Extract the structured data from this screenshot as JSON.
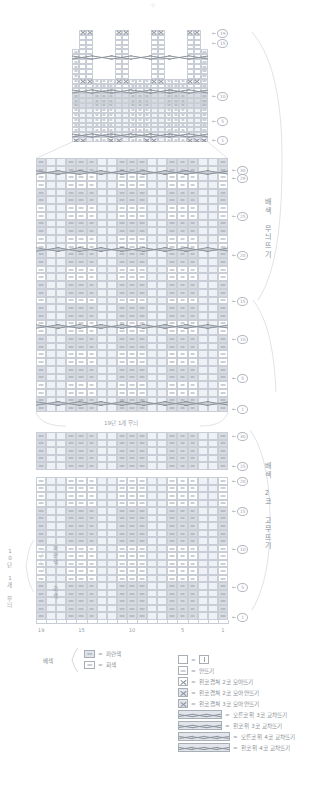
{
  "meta": {
    "doc_type": "knitting-chart",
    "language": "ko"
  },
  "labels": {
    "top_section_right": "배색 무늬뜨기",
    "bottom_section_right": "배색 2코 고무뜨기",
    "left_repeat": "10단 1개 무늬",
    "left_color_blue": "파란색",
    "left_color_gray": "회색",
    "middle_caption": "19단 1개 무늬",
    "base_color_label": "배색"
  },
  "color_legend": {
    "items": [
      {
        "swatch": "blue",
        "equals": "=",
        "name": "파란색"
      },
      {
        "swatch": "white",
        "equals": "=",
        "name": "회색"
      }
    ]
  },
  "symbol_legend": {
    "items": [
      {
        "symbol": "box-bar",
        "equals": "=",
        "label": ""
      },
      {
        "symbol": "purl",
        "equals": "=",
        "label": "안뜨기"
      },
      {
        "symbol": "k2tog-left",
        "equals": "=",
        "label": "왼코 겹쳐 2코 모아뜨기"
      },
      {
        "symbol": "k2tog-left-p",
        "equals": "=",
        "label": "왼코 겹쳐 2코 모아 안뜨기"
      },
      {
        "symbol": "k3tog-left-p",
        "equals": "=",
        "label": "왼코 겹쳐 3코 모아 안뜨기"
      },
      {
        "symbol": "cable-r3",
        "equals": "=",
        "label": "오른코 위 3코 교차뜨기"
      },
      {
        "symbol": "cable-l3",
        "equals": "=",
        "label": "왼코 위 3코 교차뜨기"
      },
      {
        "symbol": "cable-r4",
        "equals": "=",
        "label": "오른코 위 4코 교차뜨기"
      },
      {
        "symbol": "cable-l4",
        "equals": "=",
        "label": "왼코 위 4코 교차뜨기"
      }
    ]
  },
  "chart_data": {
    "type": "table",
    "xlabel": "코 (stitches)",
    "ylabel": "단 (rows)",
    "column_tick_labels": [
      "19",
      "15",
      "10",
      "5",
      "1"
    ],
    "column_tick_positions": [
      19,
      15,
      10,
      5,
      1
    ],
    "columns_total": 19,
    "sections": [
      {
        "name": "top-shaping",
        "row_tick_labels": [
          "1",
          "5",
          "10",
          "15",
          "19"
        ],
        "rows": 23,
        "cols": 19,
        "note": "shaped / decreasing top with cable crossings"
      },
      {
        "name": "main-colorwork",
        "row_tick_labels": [
          "1",
          "5",
          "10",
          "15",
          "20",
          "25",
          "29",
          "30"
        ],
        "rows": 33,
        "cols": 19,
        "repeat_caption": "19단 1개 무늬"
      },
      {
        "name": "ribbing",
        "row_tick_labels": [
          "1",
          "5",
          "10",
          "15",
          "20",
          "25",
          "30"
        ],
        "rows": 25,
        "cols": 19,
        "repeat_caption": "10단 1개 무늬"
      }
    ]
  }
}
